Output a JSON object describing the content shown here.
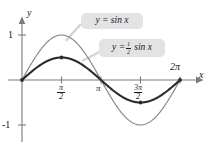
{
  "figure": {
    "background_color": "#ffffff",
    "callouts": [
      {
        "id": "sin",
        "text_prefix": "y = sin x",
        "name": "callout-sin-label",
        "box_color": "#e2e3e5"
      },
      {
        "id": "half-sin",
        "lhs": "y =",
        "frac_num": "1",
        "frac_den": "2",
        "rhs": "sin x",
        "name": "callout-half-sin-label",
        "box_color": "#e2e3e5"
      }
    ],
    "axes": {
      "y_axis_label": "y",
      "x_axis_label": "x",
      "y_ticks": [
        {
          "label": "1",
          "value": 1
        },
        {
          "label": "-1",
          "value": -1
        }
      ],
      "x_ticks": [
        {
          "label": "π/2",
          "num": "π",
          "den": "2",
          "value": 1.5707963
        },
        {
          "label": "π",
          "num": "π",
          "den": "",
          "value": 3.1415927
        },
        {
          "label": "3π/2",
          "num": "3π",
          "den": "2",
          "value": 4.712389
        },
        {
          "label": "2π",
          "num": "2π",
          "den": "",
          "value": 6.2831853
        }
      ]
    }
  },
  "chart_data": {
    "type": "line",
    "title": "",
    "xlabel": "x",
    "ylabel": "y",
    "xlim": [
      0,
      6.2831853
    ],
    "ylim": [
      -1.15,
      1.15
    ],
    "grid": false,
    "legend": "inline-callouts",
    "xtick_values": [
      1.5707963,
      3.1415927,
      4.712389,
      6.2831853
    ],
    "xtick_labels": [
      "π/2",
      "π",
      "3π/2",
      "2π"
    ],
    "ytick_values": [
      1,
      -1
    ],
    "ytick_labels": [
      "1",
      "-1"
    ],
    "series": [
      {
        "name": "y = sin x",
        "color": "#8a8a8a",
        "linewidth": 1.2,
        "markers": [],
        "x": [
          0,
          0.3141593,
          0.6283185,
          0.9424778,
          1.2566371,
          1.5707963,
          1.8849556,
          2.1991149,
          2.5132741,
          2.8274334,
          3.1415927,
          3.4557519,
          3.7699112,
          4.0840704,
          4.3982297,
          4.712389,
          5.0265482,
          5.3407075,
          5.6548668,
          5.969026,
          6.2831853
        ],
        "y": [
          0,
          0.309,
          0.588,
          0.809,
          0.951,
          1.0,
          0.951,
          0.809,
          0.588,
          0.309,
          0,
          -0.309,
          -0.588,
          -0.809,
          -0.951,
          -1.0,
          -0.951,
          -0.809,
          -0.588,
          -0.309,
          0
        ]
      },
      {
        "name": "y = 1/2 sin x",
        "color": "#2b2b2b",
        "linewidth": 2.1,
        "markers": [
          {
            "x": 0,
            "y": 0
          },
          {
            "x": 1.5707963,
            "y": 0.5
          },
          {
            "x": 4.712389,
            "y": -0.5
          },
          {
            "x": 6.2831853,
            "y": 0
          }
        ],
        "x": [
          0,
          0.3141593,
          0.6283185,
          0.9424778,
          1.2566371,
          1.5707963,
          1.8849556,
          2.1991149,
          2.5132741,
          2.8274334,
          3.1415927,
          3.4557519,
          3.7699112,
          4.0840704,
          4.3982297,
          4.712389,
          5.0265482,
          5.3407075,
          5.6548668,
          5.969026,
          6.2831853
        ],
        "y": [
          0,
          0.1545,
          0.294,
          0.4045,
          0.4755,
          0.5,
          0.4755,
          0.4045,
          0.294,
          0.1545,
          0,
          -0.1545,
          -0.294,
          -0.4045,
          -0.4755,
          -0.5,
          -0.4755,
          -0.4045,
          -0.294,
          -0.1545,
          0
        ]
      }
    ]
  }
}
